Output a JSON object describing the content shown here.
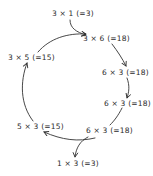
{
  "diagram": {
    "type": "cycle",
    "nodes": [
      {
        "id": "n1",
        "text": "3 × 1 (=3)"
      },
      {
        "id": "n2",
        "text": "3 × 6 (=18)"
      },
      {
        "id": "n3",
        "text": "6 × 3 (=18)"
      },
      {
        "id": "n4",
        "text": "6 × 3 (=18)"
      },
      {
        "id": "n5",
        "text": "6 × 3 (=18)"
      },
      {
        "id": "n6",
        "text": "1 × 3 (=3)"
      },
      {
        "id": "n7",
        "text": "5 × 3 (=15)"
      },
      {
        "id": "n8",
        "text": "3 × 5 (=15)"
      }
    ],
    "edges": [
      {
        "from": "n1",
        "to": "n2"
      },
      {
        "from": "n8",
        "to": "n2"
      },
      {
        "from": "n2",
        "to": "n3"
      },
      {
        "from": "n3",
        "to": "n4"
      },
      {
        "from": "n4",
        "to": "n5"
      },
      {
        "from": "n5",
        "to": "n6"
      },
      {
        "from": "n5",
        "to": "n7"
      },
      {
        "from": "n7",
        "to": "n8"
      }
    ],
    "stroke_color": "#333333",
    "text_color": "#2a2a2a"
  }
}
